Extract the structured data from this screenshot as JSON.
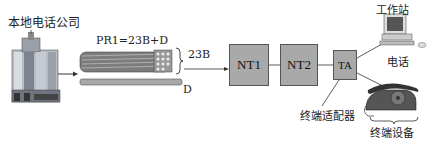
{
  "labels": {
    "central_office": "本地电话公司",
    "pri_formula": "PR1=23B+D",
    "b_channels": "23B",
    "d_channel": "D",
    "workstation": "工作站",
    "phone": "电话",
    "terminal_adapter": "终端适配器",
    "terminal_equipment": "终端设备"
  },
  "nodes": [
    {
      "id": "nt1",
      "label": "NT1"
    },
    {
      "id": "nt2",
      "label": "NT2"
    },
    {
      "id": "ta",
      "label": "TA"
    }
  ],
  "colors": {
    "box_fill": "#a9a9a9",
    "line": "#333333"
  }
}
